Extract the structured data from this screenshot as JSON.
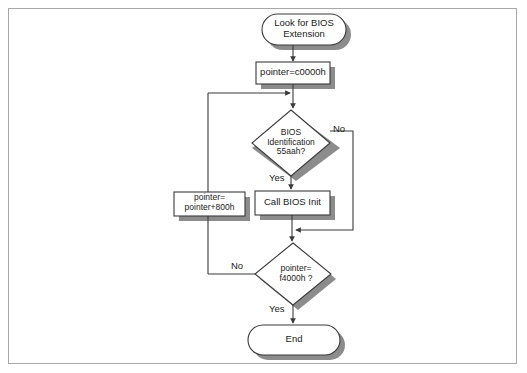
{
  "diagram": {
    "colors": {
      "stroke": "#3a3a3a",
      "shadow": "#8c8c8c",
      "fill": "#ffffff",
      "frame_border": "#a8a8a8",
      "page_background": "#ffffff",
      "text": "#1a1a1a"
    },
    "nodes": [
      {
        "id": "start",
        "shape": "terminator",
        "label": "Look for BIOS\nExtension",
        "x": 262,
        "y": 14,
        "w": 84,
        "h": 31,
        "font_size": 9.5
      },
      {
        "id": "init-pointer",
        "shape": "process",
        "label": "pointer=c0000h",
        "x": 256,
        "y": 62,
        "w": 74,
        "h": 22,
        "font_size": 9.5
      },
      {
        "id": "bios-id-check",
        "shape": "decision",
        "label": "BIOS\nIdentification\n55aah?",
        "x": 252,
        "y": 110,
        "w": 78,
        "h": 66,
        "font_size": 8.5
      },
      {
        "id": "call-bios-init",
        "shape": "process",
        "label": "Call BIOS Init",
        "x": 255,
        "y": 191,
        "w": 75,
        "h": 24,
        "font_size": 9.5
      },
      {
        "id": "advance-pointer",
        "shape": "process",
        "label": "pointer=\npointer+800h",
        "x": 174,
        "y": 192,
        "w": 71,
        "h": 24,
        "font_size": 8.5
      },
      {
        "id": "pointer-limit-check",
        "shape": "decision",
        "label": "pointer=\nf4000h ?",
        "x": 255,
        "y": 243,
        "w": 76,
        "h": 62,
        "font_size": 8.5
      },
      {
        "id": "end",
        "shape": "terminator",
        "label": "End",
        "x": 248,
        "y": 325,
        "w": 92,
        "h": 30,
        "font_size": 9.5
      }
    ],
    "edge_labels": [
      {
        "id": "bios-no",
        "text": "No",
        "x": 333,
        "y": 128
      },
      {
        "id": "bios-yes",
        "text": "Yes",
        "x": 269,
        "y": 176
      },
      {
        "id": "limit-no",
        "text": "No",
        "x": 231,
        "y": 264
      },
      {
        "id": "limit-yes",
        "text": "Yes",
        "x": 269,
        "y": 306
      }
    ],
    "edges": [
      {
        "id": "start-to-init",
        "from": "start",
        "to": "init-pointer"
      },
      {
        "id": "init-to-bios-check",
        "from": "init-pointer",
        "to": "bios-id-check"
      },
      {
        "id": "bios-yes-to-call",
        "from": "bios-id-check",
        "to": "call-bios-init",
        "label": "Yes"
      },
      {
        "id": "bios-no-bypass",
        "from": "bios-id-check",
        "to": "pointer-limit-check",
        "label": "No"
      },
      {
        "id": "call-to-limit-check",
        "from": "call-bios-init",
        "to": "pointer-limit-check"
      },
      {
        "id": "limit-no-to-advance",
        "from": "pointer-limit-check",
        "to": "advance-pointer",
        "label": "No"
      },
      {
        "id": "advance-loop-back",
        "from": "advance-pointer",
        "to": "bios-id-check"
      },
      {
        "id": "limit-yes-to-end",
        "from": "pointer-limit-check",
        "to": "end",
        "label": "Yes"
      }
    ]
  }
}
